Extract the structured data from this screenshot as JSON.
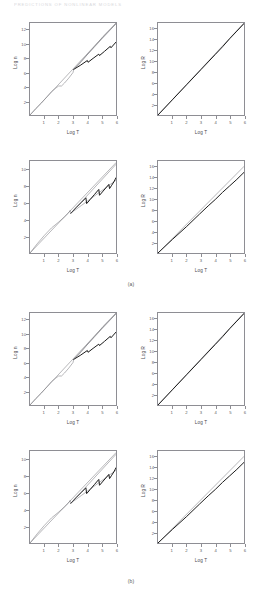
{
  "running_head": "PREDICTIONS OF NONLINEAR MODELS",
  "figure": {
    "captions": [
      {
        "label": "(a)",
        "after_row": 1
      },
      {
        "label": "(b)",
        "after_row": 3
      }
    ]
  },
  "chart_data": [
    {
      "id": "panel-r1c1",
      "type": "line",
      "title": "",
      "xlabel": "Log T",
      "ylabel": "Log n",
      "xlim": [
        0,
        6
      ],
      "ylim": [
        0,
        13
      ],
      "xticks": [
        1,
        2,
        3,
        4,
        5,
        6
      ],
      "yticks": [
        2,
        4,
        6,
        8,
        10,
        12
      ],
      "grid": false,
      "legend": "none",
      "series": [
        {
          "name": "envelope-upper",
          "style": "thin",
          "x": [
            0,
            6
          ],
          "y": [
            0,
            13.0
          ]
        },
        {
          "name": "trajectory",
          "style": "thin",
          "x": [
            0.0,
            0.4,
            0.8,
            1.2,
            1.5,
            1.8,
            2.0,
            2.2,
            2.4,
            2.7,
            3.0,
            3.05,
            3.3,
            3.6,
            3.9,
            4.2,
            4.5,
            4.8,
            5.1,
            5.4,
            5.7,
            6.0
          ],
          "y": [
            0.0,
            0.9,
            1.7,
            2.6,
            3.3,
            3.8,
            4.1,
            4.1,
            4.5,
            5.2,
            6.0,
            6.45,
            6.9,
            7.6,
            8.3,
            9.0,
            9.7,
            10.4,
            11.1,
            11.7,
            12.3,
            12.9
          ]
        },
        {
          "name": "sawtooth-lower",
          "style": "bold",
          "x": [
            3.05,
            3.5,
            4.0,
            4.05,
            4.4,
            4.8,
            4.85,
            5.2,
            5.6,
            5.65,
            6.0
          ],
          "y": [
            6.45,
            7.0,
            7.7,
            7.45,
            8.0,
            8.6,
            8.4,
            9.0,
            9.7,
            9.5,
            10.3
          ]
        },
        {
          "name": "sawtooth-envelope",
          "style": "thin",
          "x": [
            3.05,
            6.0
          ],
          "y": [
            6.45,
            12.9
          ]
        }
      ]
    },
    {
      "id": "panel-r1c2",
      "type": "line",
      "title": "",
      "xlabel": "Log T",
      "ylabel": "Log R",
      "xlim": [
        0,
        6
      ],
      "ylim": [
        0,
        17
      ],
      "xticks": [
        1,
        2,
        3,
        4,
        5,
        6
      ],
      "yticks": [
        2,
        4,
        6,
        8,
        10,
        12,
        14,
        16
      ],
      "grid": false,
      "legend": "none",
      "series": [
        {
          "name": "reference-line",
          "style": "thin",
          "x": [
            0,
            6
          ],
          "y": [
            0,
            17.0
          ]
        },
        {
          "name": "trajectory",
          "style": "bold",
          "x": [
            0.0,
            1.0,
            2.0,
            3.0,
            3.5,
            4.0,
            4.5,
            5.0,
            5.5,
            6.0
          ],
          "y": [
            0.0,
            2.8,
            5.6,
            8.4,
            9.8,
            11.2,
            12.6,
            14.1,
            15.5,
            16.9
          ]
        }
      ]
    },
    {
      "id": "panel-r2c1",
      "type": "line",
      "title": "",
      "xlabel": "Log T",
      "ylabel": "Log n",
      "xlim": [
        0,
        6
      ],
      "ylim": [
        0,
        11
      ],
      "xticks": [
        1,
        2,
        3,
        4,
        5,
        6
      ],
      "yticks": [
        2,
        4,
        6,
        8,
        10
      ],
      "grid": false,
      "legend": "none",
      "series": [
        {
          "name": "envelope-upper",
          "style": "thin",
          "x": [
            0,
            6
          ],
          "y": [
            0,
            10.8
          ]
        },
        {
          "name": "trajectory",
          "style": "thin",
          "x": [
            0.0,
            0.5,
            1.0,
            1.5,
            2.0,
            2.4,
            2.7,
            2.8,
            2.85,
            3.2,
            3.6,
            4.0,
            4.4,
            4.8,
            5.2,
            5.6,
            6.0
          ],
          "y": [
            0.0,
            1.1,
            2.1,
            3.0,
            3.7,
            4.3,
            4.8,
            5.1,
            4.75,
            5.2,
            5.7,
            6.2,
            6.7,
            7.2,
            7.7,
            8.2,
            8.7
          ]
        },
        {
          "name": "sawtooth-bold",
          "style": "bold",
          "x": [
            2.85,
            3.2,
            3.55,
            3.9,
            3.95,
            4.2,
            4.5,
            4.8,
            4.85,
            5.1,
            5.35,
            5.5,
            5.55,
            5.7,
            5.85,
            6.0
          ],
          "y": [
            4.75,
            5.4,
            6.0,
            6.6,
            5.9,
            6.4,
            7.0,
            7.6,
            6.9,
            7.4,
            7.9,
            8.2,
            7.7,
            8.1,
            8.5,
            9.0
          ]
        },
        {
          "name": "envelope-saw-upper",
          "style": "thin",
          "x": [
            2.85,
            6.0
          ],
          "y": [
            4.75,
            10.6
          ]
        }
      ]
    },
    {
      "id": "panel-r2c2",
      "type": "line",
      "title": "",
      "xlabel": "Log T",
      "ylabel": "Log R",
      "xlim": [
        0,
        6
      ],
      "ylim": [
        0,
        17
      ],
      "xticks": [
        1,
        2,
        3,
        4,
        5,
        6
      ],
      "yticks": [
        2,
        4,
        6,
        8,
        10,
        12,
        14,
        16
      ],
      "grid": false,
      "legend": "none",
      "series": [
        {
          "name": "reference-line",
          "style": "thin",
          "x": [
            0,
            6
          ],
          "y": [
            0,
            16.0
          ]
        },
        {
          "name": "trajectory",
          "style": "bold",
          "x": [
            0.0,
            1.0,
            2.0,
            2.9,
            3.5,
            4.0,
            4.5,
            5.0,
            5.5,
            6.0
          ],
          "y": [
            0.0,
            2.5,
            4.9,
            7.2,
            8.7,
            9.9,
            11.2,
            12.4,
            13.6,
            14.9
          ]
        }
      ]
    },
    {
      "id": "panel-r3c1",
      "type": "line",
      "title": "",
      "xlabel": "Log T",
      "ylabel": "Log n",
      "xlim": [
        0,
        6
      ],
      "ylim": [
        0,
        13
      ],
      "xticks": [
        1,
        2,
        3,
        4,
        5,
        6
      ],
      "yticks": [
        2,
        4,
        6,
        8,
        10,
        12
      ],
      "grid": false,
      "legend": "none",
      "series": [
        {
          "name": "envelope-upper",
          "style": "thin",
          "x": [
            0,
            6
          ],
          "y": [
            0,
            13.0
          ]
        },
        {
          "name": "trajectory",
          "style": "thin",
          "x": [
            0.0,
            0.4,
            0.8,
            1.2,
            1.5,
            1.8,
            2.0,
            2.2,
            2.4,
            2.7,
            3.0,
            3.05,
            3.3,
            3.6,
            3.9,
            4.2,
            4.5,
            4.8,
            5.1,
            5.4,
            5.7,
            6.0
          ],
          "y": [
            0.0,
            0.9,
            1.7,
            2.6,
            3.3,
            3.8,
            4.1,
            4.1,
            4.5,
            5.2,
            6.0,
            6.45,
            6.9,
            7.6,
            8.3,
            9.0,
            9.7,
            10.4,
            11.1,
            11.7,
            12.3,
            12.9
          ]
        },
        {
          "name": "sawtooth-lower",
          "style": "bold",
          "x": [
            3.05,
            3.5,
            4.0,
            4.05,
            4.4,
            4.8,
            4.85,
            5.2,
            5.6,
            5.65,
            6.0
          ],
          "y": [
            6.45,
            7.0,
            7.7,
            7.45,
            8.0,
            8.6,
            8.4,
            9.0,
            9.7,
            9.5,
            10.3
          ]
        },
        {
          "name": "sawtooth-envelope",
          "style": "thin",
          "x": [
            3.05,
            6.0
          ],
          "y": [
            6.45,
            12.9
          ]
        }
      ]
    },
    {
      "id": "panel-r3c2",
      "type": "line",
      "title": "",
      "xlabel": "Log T",
      "ylabel": "Log R",
      "xlim": [
        0,
        6
      ],
      "ylim": [
        0,
        17
      ],
      "xticks": [
        1,
        2,
        3,
        4,
        5,
        6
      ],
      "yticks": [
        2,
        4,
        6,
        8,
        10,
        12,
        14,
        16
      ],
      "grid": false,
      "legend": "none",
      "series": [
        {
          "name": "reference-line",
          "style": "thin",
          "x": [
            0,
            6
          ],
          "y": [
            0,
            17.0
          ]
        },
        {
          "name": "trajectory",
          "style": "bold",
          "x": [
            0.0,
            1.0,
            2.0,
            3.0,
            3.5,
            4.0,
            4.5,
            5.0,
            5.5,
            6.0
          ],
          "y": [
            0.0,
            2.8,
            5.6,
            8.4,
            9.8,
            11.2,
            12.6,
            14.1,
            15.5,
            16.9
          ]
        }
      ]
    },
    {
      "id": "panel-r4c1",
      "type": "line",
      "title": "",
      "xlabel": "Log T",
      "ylabel": "Log n",
      "xlim": [
        0,
        6
      ],
      "ylim": [
        0,
        11
      ],
      "xticks": [
        1,
        2,
        3,
        4,
        5,
        6
      ],
      "yticks": [
        2,
        4,
        6,
        8,
        10
      ],
      "grid": false,
      "legend": "none",
      "series": [
        {
          "name": "envelope-upper",
          "style": "thin",
          "x": [
            0,
            6
          ],
          "y": [
            0,
            10.8
          ]
        },
        {
          "name": "trajectory",
          "style": "thin",
          "x": [
            0.0,
            0.5,
            1.0,
            1.5,
            2.0,
            2.4,
            2.7,
            2.8,
            2.85,
            3.2,
            3.6,
            4.0,
            4.4,
            4.8,
            5.2,
            5.6,
            6.0
          ],
          "y": [
            0.0,
            1.1,
            2.1,
            3.0,
            3.7,
            4.3,
            4.8,
            5.1,
            4.75,
            5.2,
            5.7,
            6.2,
            6.7,
            7.2,
            7.7,
            8.2,
            8.7
          ]
        },
        {
          "name": "sawtooth-bold",
          "style": "bold",
          "x": [
            2.85,
            3.2,
            3.55,
            3.9,
            3.95,
            4.2,
            4.5,
            4.8,
            4.85,
            5.1,
            5.35,
            5.5,
            5.55,
            5.7,
            5.85,
            6.0
          ],
          "y": [
            4.75,
            5.4,
            6.0,
            6.6,
            5.9,
            6.4,
            7.0,
            7.6,
            6.9,
            7.4,
            7.9,
            8.2,
            7.7,
            8.1,
            8.5,
            9.0
          ]
        },
        {
          "name": "envelope-saw-upper",
          "style": "thin",
          "x": [
            2.85,
            6.0
          ],
          "y": [
            4.75,
            10.6
          ]
        }
      ]
    },
    {
      "id": "panel-r4c2",
      "type": "line",
      "title": "",
      "xlabel": "Log T",
      "ylabel": "Log R",
      "xlim": [
        0,
        6
      ],
      "ylim": [
        0,
        17
      ],
      "xticks": [
        1,
        2,
        3,
        4,
        5,
        6
      ],
      "yticks": [
        2,
        4,
        6,
        8,
        10,
        12,
        14,
        16
      ],
      "grid": false,
      "legend": "none",
      "series": [
        {
          "name": "reference-line",
          "style": "thin",
          "x": [
            0,
            6
          ],
          "y": [
            0,
            16.0
          ]
        },
        {
          "name": "trajectory",
          "style": "bold",
          "x": [
            0.0,
            1.0,
            2.0,
            2.9,
            3.5,
            4.0,
            4.5,
            5.0,
            5.5,
            6.0
          ],
          "y": [
            0.0,
            2.5,
            4.9,
            7.2,
            8.7,
            9.9,
            11.2,
            12.4,
            13.6,
            14.9
          ]
        }
      ]
    }
  ]
}
